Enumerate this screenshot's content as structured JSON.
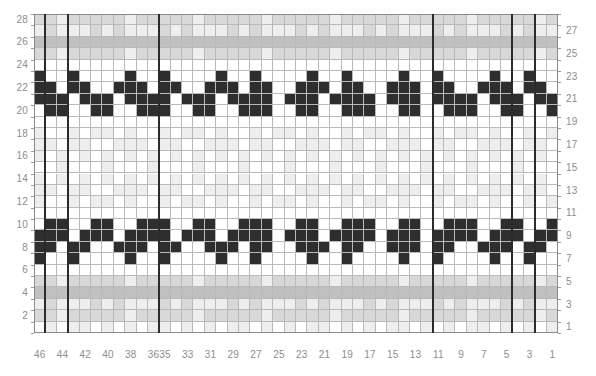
{
  "chart_data": {
    "type": "heatmap",
    "xlabel": "",
    "ylabel": "",
    "grid": true,
    "legend_position": "none",
    "columns": 46,
    "rows": 28,
    "x_axis": {
      "position": "bottom",
      "direction": "right-to-left",
      "tick_labels": [
        "46",
        "44",
        "42",
        "40",
        "38",
        "36",
        "35",
        "33",
        "31",
        "29",
        "27",
        "25",
        "23",
        "21",
        "19",
        "17",
        "15",
        "13",
        "11",
        "9",
        "7",
        "5",
        "3",
        "1"
      ],
      "tick_columns": [
        46,
        44,
        42,
        40,
        38,
        36,
        35,
        33,
        31,
        29,
        27,
        25,
        23,
        21,
        19,
        17,
        15,
        13,
        11,
        9,
        7,
        5,
        3,
        1
      ]
    },
    "y_axis_left": {
      "position": "left",
      "tick_labels": [
        "28",
        "26",
        "24",
        "22",
        "20",
        "18",
        "16",
        "14",
        "12",
        "10",
        "8",
        "6",
        "4",
        "2"
      ],
      "tick_rows": [
        28,
        26,
        24,
        22,
        20,
        18,
        16,
        14,
        12,
        10,
        8,
        6,
        4,
        2
      ]
    },
    "y_axis_right": {
      "position": "right",
      "tick_labels": [
        "27",
        "25",
        "23",
        "21",
        "19",
        "17",
        "15",
        "13",
        "11",
        "9",
        "7",
        "5",
        "3",
        "1"
      ],
      "tick_rows": [
        27,
        25,
        23,
        21,
        19,
        17,
        15,
        13,
        11,
        9,
        7,
        5,
        3,
        1
      ]
    },
    "palette": {
      "dark": "#2e2e2e",
      "grey": "#c0c0c0",
      "mid": "#d8d8d8",
      "light": "#eeeeee",
      "white": "#ffffff",
      "gridline": "#b9b9b9",
      "heavy_line": "#2b2b2b",
      "label_text": "#8d8d8d"
    },
    "repeat_lines": {
      "vertical_after_columns": [
        45,
        43,
        35,
        11,
        4,
        2
      ],
      "horizontal_after_rows": []
    },
    "cells": {
      "encoding": "rows listed top (row 28) to bottom (row 1); each string has 46 characters, left char = column 46, right char = column 1; . = white, l = light, m = mid, g = grey, # = dark",
      "rows": [
        "mmlmmmmmlmmmmmlmmmmmlmmmmmlmmmmmlmmmmmlmmmmmlmmm",
        "lmlllmlmlllmlmlllmlmlllmlmlllmlmlllmlmlllmlmlllm",
        "gggggggggggggggggggggggggggggggggggggggggggggg",
        "mmlmmmmmlmmmmmlmmmmmlmmmmmlmmmmmlmmmmmlmmmmmlmm",
        "..............................................",
        "#..#....#..#....#..#....#..#....#..#....#..#..",
        "##.##..###.##..###.##..###.##..###.##..###.##.",
        "###.###.####.###.####.###.####.###.####.###.##",
        ".##..##..###..##..###..##..###..##..###..##..#",
        "..............................................",
        "l..l.ll.l..l.ll.l..l.ll.l..l.ll.l..l.ll.l..l.l",
        "ll.ll..lll.ll..lll.ll..lll.ll..lll.ll..lll.ll.",
        "l.l.l.l.l.l.l.l.l.l.l.l.l.l.l.l.l.l.l.l.l.l.l.",
        "..l...l...l...l...l...l...l...l...l...l...l...",
        "l.l.l.l.l.l.l.l.l.l.l.l.l.l.l.l.l.l.l.l.l.l.l.",
        "ll.ll..lll.ll..lll.ll..lll.ll..lll.ll..lll.ll.",
        "l..l.ll.l..l.ll.l..l.ll.l..l.ll.l..l.ll.l..l.l",
        "..............................................",
        ".##..##..###..##..###..##..###..##..###..##..#",
        "###.###.####.###.####.###.####.###.####.###.##",
        "##.##..###.##..###.##..###.##..###.##..###.##.",
        "#..#....#..#....#..#....#..#....#..#....#..#..",
        "..............................................",
        "mmlmmmmmlmmmmmlmmmmmlmmmmmlmmmmmlmmmmmlmmmmmlmm",
        "gggggggggggggggggggggggggggggggggggggggggggggg",
        "lmlllmlmlllmlmlllmlmlllmlmlllmlmlllmlmlllmlmlllm",
        "mmlmmmmmlmmmmmlmmmmmlmmmmmlmmmmmlmmmmmlmmmmmlmm",
        ".l.ll.l.l.ll.l.l.ll.l.l.ll.l.l.ll.l.l.ll.l.l.l"
      ]
    },
    "motifs": [
      {
        "name": "upper-bird-band",
        "rows": "20-24",
        "repeats": 5,
        "description": "dark V / bird wing motif repeated horizontally"
      },
      {
        "name": "lower-bird-band",
        "rows": "9-13",
        "repeats": 5,
        "description": "inverted dark V / bird wing motif repeated horizontally"
      },
      {
        "name": "grey-band-top",
        "rows": "25-28",
        "description": "horizontal grey speckled band"
      },
      {
        "name": "grey-band-middle",
        "rows": "6-8",
        "description": "horizontal grey speckled band"
      }
    ]
  }
}
